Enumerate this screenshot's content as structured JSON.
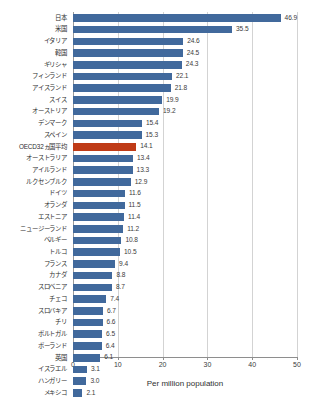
{
  "chart_data": {
    "type": "bar",
    "orientation": "horizontal",
    "title": "",
    "subtitle": "",
    "xlabel": "Per million population",
    "ylabel": "",
    "xlim": [
      0,
      50
    ],
    "xticks": [
      0,
      10,
      20,
      30,
      40,
      50
    ],
    "grid": true,
    "legend": null,
    "categories": [
      "日本",
      "米国",
      "イタリア",
      "韓国",
      "ギリシャ",
      "フィンランド",
      "アイスランド",
      "スイス",
      "オーストリア",
      "デンマーク",
      "スペイン",
      "OECD32ヵ国平均",
      "オーストラリア",
      "アイルランド",
      "ルクセンブルク",
      "ドイツ",
      "オランダ",
      "エストニア",
      "ニュージーランド",
      "ベルギー",
      "トルコ",
      "フランス",
      "カナダ",
      "スロベニア",
      "チェコ",
      "スロバキア",
      "チリ",
      "ポルトガル",
      "ポーランド",
      "英国",
      "イスラエル",
      "ハンガリー",
      "メキシコ"
    ],
    "values": [
      46.9,
      35.5,
      24.6,
      24.5,
      24.3,
      22.1,
      21.8,
      19.9,
      19.2,
      15.4,
      15.3,
      14.1,
      13.4,
      13.3,
      12.9,
      11.6,
      11.5,
      11.4,
      11.2,
      10.8,
      10.5,
      9.4,
      8.8,
      8.7,
      7.4,
      6.7,
      6.6,
      6.5,
      6.4,
      6.1,
      3.1,
      3.0,
      2.1
    ],
    "value_labels": [
      "46.9",
      "35.5",
      "24.6",
      "24.5",
      "24.3",
      "22.1",
      "21.8",
      "19.9",
      "19.2",
      "15.4",
      "15.3",
      "14.1",
      "13.4",
      "13.3",
      "12.9",
      "11.6",
      "11.5",
      "11.4",
      "11.2",
      "10.8",
      "10.5",
      "9.4",
      "8.8",
      "8.7",
      "7.4",
      "6.7",
      "6.6",
      "6.5",
      "6.4",
      "6.1",
      "3.1",
      "3.0",
      "2.1"
    ],
    "highlight_index": 11,
    "colors": {
      "bar": "#41699c",
      "highlight_bar": "#bf3b17",
      "gridline": "#d3d3d3",
      "axis": "#8e8e8e",
      "text": "#3b3b3b",
      "background": "#ffffff"
    }
  }
}
